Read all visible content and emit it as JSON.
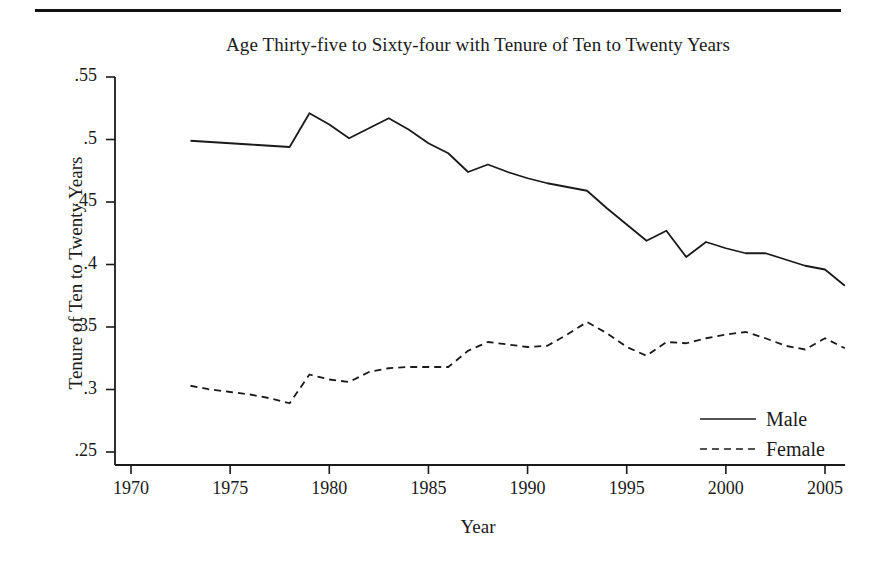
{
  "figure": {
    "title": "Age Thirty-five to Sixty-four with Tenure of Ten to Twenty Years",
    "x_axis_title": "Year",
    "y_axis_title": "Tenure of Ten to Twenty Years",
    "ink_color": "#1a1a1a",
    "background": "#ffffff"
  },
  "legend": {
    "male_label": "Male",
    "female_label": "Female"
  },
  "chart_data": {
    "type": "line",
    "title": "Age Thirty-five to Sixty-four with Tenure of Ten to Twenty Years",
    "xlabel": "Year",
    "ylabel": "Tenure of Ten to Twenty Years",
    "xlim": [
      1969,
      2007
    ],
    "ylim": [
      0.235,
      0.565
    ],
    "xticks": [
      1970,
      1975,
      1980,
      1985,
      1990,
      1995,
      2000,
      2005
    ],
    "xtick_labels": [
      "1970",
      "1975",
      "1980",
      "1985",
      "1990",
      "1995",
      "2000",
      "2005"
    ],
    "yticks": [
      0.25,
      0.3,
      0.35,
      0.4,
      0.45,
      0.5,
      0.55
    ],
    "ytick_labels": [
      ".25",
      ".3",
      ".35",
      ".4",
      ".45",
      ".5",
      ".55"
    ],
    "grid": false,
    "legend_position": "lower right",
    "x": [
      1973,
      1974,
      1975,
      1976,
      1977,
      1978,
      1979,
      1980,
      1981,
      1982,
      1983,
      1984,
      1985,
      1986,
      1987,
      1988,
      1989,
      1990,
      1991,
      1992,
      1993,
      1994,
      1995,
      1996,
      1997,
      1998,
      1999,
      2000,
      2001,
      2002,
      2003,
      2004,
      2005,
      2006
    ],
    "series": [
      {
        "name": "Male",
        "style": "solid",
        "color": "#1a1a1a",
        "values": [
          0.499,
          0.498,
          0.497,
          0.496,
          0.495,
          0.494,
          0.521,
          0.512,
          0.501,
          0.509,
          0.517,
          0.508,
          0.497,
          0.489,
          0.474,
          0.48,
          0.474,
          0.469,
          0.465,
          0.462,
          0.459,
          0.445,
          0.432,
          0.419,
          0.427,
          0.406,
          0.418,
          0.413,
          0.409,
          0.409,
          0.404,
          0.399,
          0.396,
          0.383
        ]
      },
      {
        "name": "Female",
        "style": "dashed",
        "color": "#1a1a1a",
        "values": [
          0.303,
          0.3,
          0.298,
          0.296,
          0.293,
          0.289,
          0.312,
          0.308,
          0.306,
          0.314,
          0.317,
          0.318,
          0.318,
          0.318,
          0.331,
          0.338,
          0.336,
          0.334,
          0.335,
          0.344,
          0.354,
          0.345,
          0.334,
          0.327,
          0.338,
          0.337,
          0.341,
          0.344,
          0.346,
          0.341,
          0.335,
          0.332,
          0.341,
          0.333
        ]
      }
    ]
  }
}
